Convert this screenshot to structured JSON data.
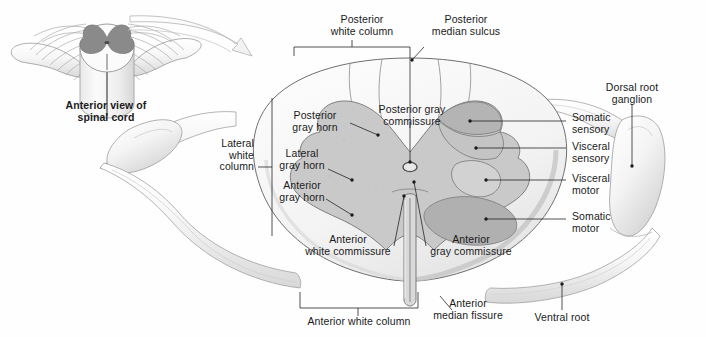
{
  "figure": {
    "background_color": "#fefefe",
    "ink_color": "#1a1a1a",
    "white_matter_color": "#f2f2f2",
    "gray_matter_color": "#c9c9c9",
    "gray_matter_dark_color": "#8a8a8a",
    "nuclei_colors": [
      "#b4b4b4",
      "#c4c4c4",
      "#d2d2d2",
      "#b0b0b0"
    ]
  },
  "inset": {
    "caption_line1": "Anterior view of",
    "caption_line2": "spinal cord",
    "arrow_name": "magnification-arrow"
  },
  "labels": {
    "posterior_white_column": "Posterior\nwhite column",
    "posterior_median_sulcus": "Posterior\nmedian sulcus",
    "posterior_gray_horn": "Posterior\ngray horn",
    "lateral_gray_horn": "Lateral\ngray horn",
    "anterior_gray_horn": "Anterior\ngray horn",
    "lateral_white_column": "Lateral\nwhite\ncolumn",
    "posterior_gray_commissure": "Posterior gray\ncommissure",
    "somatic_sensory": "Somatic\nsensory",
    "visceral_sensory": "Visceral\nsensory",
    "visceral_motor": "Visceral\nmotor",
    "somatic_motor": "Somatic\nmotor",
    "dorsal_root_ganglion": "Dorsal root\nganglion",
    "anterior_white_commissure": "Anterior\nwhite commissure",
    "anterior_gray_commissure": "Anterior\ngray commissure",
    "anterior_white_column": "Anterior white column",
    "anterior_median_fissure": "Anterior\nmedian fissure",
    "ventral_root": "Ventral root"
  }
}
